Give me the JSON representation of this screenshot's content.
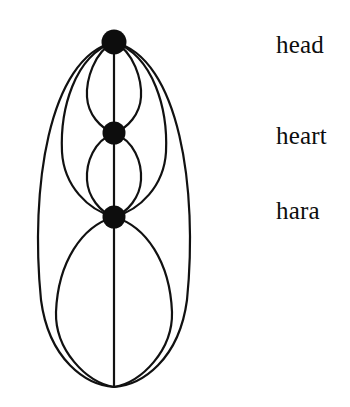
{
  "figure": {
    "background_color": "#ffffff",
    "stroke_color": "#111111",
    "node_fill_color": "#0d0d0d",
    "text_color": "#0d0d0d"
  },
  "nodes": [
    {
      "id": "head",
      "label": "head",
      "cx": 114,
      "cy": 42,
      "r": 12.5
    },
    {
      "id": "heart",
      "label": "heart",
      "cx": 114,
      "cy": 133,
      "r": 11.5
    },
    {
      "id": "hara",
      "label": "hara",
      "cx": 114,
      "cy": 217,
      "r": 11.5
    }
  ],
  "terminus": {
    "id": "base-point",
    "cx": 114,
    "cy": 387
  },
  "labels": {
    "head": "head",
    "heart": "heart",
    "hara": "hara"
  },
  "edges": [
    {
      "id": "outer-left",
      "from": "head",
      "to": "base-point",
      "side": "left",
      "bulge": 84
    },
    {
      "id": "outer-right",
      "from": "head",
      "to": "base-point",
      "side": "right",
      "bulge": 84
    },
    {
      "id": "mid-left",
      "from": "head",
      "to": "hara",
      "side": "left",
      "bulge": 55
    },
    {
      "id": "mid-right",
      "from": "head",
      "to": "hara",
      "side": "right",
      "bulge": 55
    },
    {
      "id": "upper-left",
      "from": "head",
      "to": "heart",
      "side": "left",
      "bulge": 28
    },
    {
      "id": "upper-right",
      "from": "head",
      "to": "heart",
      "side": "right",
      "bulge": 28
    },
    {
      "id": "lower-left",
      "from": "heart",
      "to": "hara",
      "side": "left",
      "bulge": 28
    },
    {
      "id": "lower-right",
      "from": "heart",
      "to": "hara",
      "side": "right",
      "bulge": 28
    },
    {
      "id": "base-left",
      "from": "hara",
      "to": "base-point",
      "side": "left",
      "bulge": 62
    },
    {
      "id": "base-right",
      "from": "hara",
      "to": "base-point",
      "side": "right",
      "bulge": 62
    },
    {
      "id": "axis",
      "from": "head",
      "to": "base-point",
      "side": "center",
      "bulge": 0
    }
  ]
}
